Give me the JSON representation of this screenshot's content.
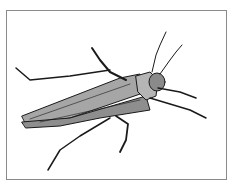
{
  "image": {
    "subject": "insect-illustration",
    "description": "Grayscale line drawing of a long-horned grasshopper/katydid viewed from above, head pointing upper-right, within a thin gray rectangular frame",
    "colors": {
      "background": "#ffffff",
      "frame": "#8a8a8a",
      "body_fill": "#9a9a9a",
      "body_light": "#bdbdbd",
      "outline": "#1a1a1a"
    }
  }
}
